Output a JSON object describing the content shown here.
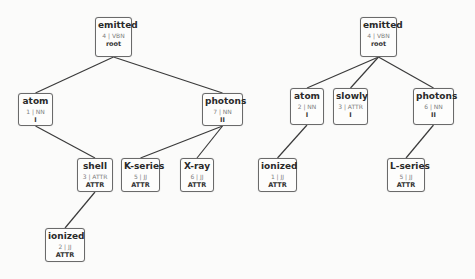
{
  "trees": [
    {
      "name": "left-tree",
      "nodes": [
        {
          "id": "L-emitted",
          "word": "emitted",
          "meta": "4 | VBN",
          "role": "root",
          "x": 95,
          "y": 17,
          "w": 37,
          "h": 40
        },
        {
          "id": "L-atom",
          "word": "atom",
          "meta": "1 | NN",
          "role": "I",
          "x": 18,
          "y": 93,
          "w": 35,
          "h": 33
        },
        {
          "id": "L-photons",
          "word": "photons",
          "meta": "7 | NN",
          "role": "II",
          "x": 202,
          "y": 93,
          "w": 41,
          "h": 33
        },
        {
          "id": "L-shell",
          "word": "shell",
          "meta": "3 | ATTR",
          "role": "ATTR",
          "x": 77,
          "y": 158,
          "w": 36,
          "h": 34
        },
        {
          "id": "L-kseries",
          "word": "K-series",
          "meta": "5 | JJ",
          "role": "ATTR",
          "x": 121,
          "y": 158,
          "w": 39,
          "h": 34
        },
        {
          "id": "L-xray",
          "word": "X-ray",
          "meta": "6 | JJ",
          "role": "ATTR",
          "x": 180,
          "y": 158,
          "w": 34,
          "h": 34
        },
        {
          "id": "L-ionized",
          "word": "ionized",
          "meta": "2 | JJ",
          "role": "ATTR",
          "x": 45,
          "y": 228,
          "w": 40,
          "h": 34
        }
      ],
      "edges": [
        [
          "L-emitted",
          "L-atom"
        ],
        [
          "L-emitted",
          "L-photons"
        ],
        [
          "L-atom",
          "L-shell"
        ],
        [
          "L-photons",
          "L-kseries"
        ],
        [
          "L-photons",
          "L-xray"
        ],
        [
          "L-shell",
          "L-ionized"
        ]
      ]
    },
    {
      "name": "right-tree",
      "nodes": [
        {
          "id": "R-emitted",
          "word": "emitted",
          "meta": "4 | VBN",
          "role": "root",
          "x": 360,
          "y": 17,
          "w": 37,
          "h": 40
        },
        {
          "id": "R-atom",
          "word": "atom",
          "meta": "2 | NN",
          "role": "I",
          "x": 290,
          "y": 88,
          "w": 34,
          "h": 37
        },
        {
          "id": "R-slowly",
          "word": "slowly",
          "meta": "3 | ATTR",
          "role": "I",
          "x": 333,
          "y": 88,
          "w": 35,
          "h": 37
        },
        {
          "id": "R-photons",
          "word": "photons",
          "meta": "6 | NN",
          "role": "II",
          "x": 413,
          "y": 88,
          "w": 41,
          "h": 37
        },
        {
          "id": "R-ionized",
          "word": "ionized",
          "meta": "1 | JJ",
          "role": "ATTR",
          "x": 258,
          "y": 158,
          "w": 39,
          "h": 34
        },
        {
          "id": "R-lseries",
          "word": "L-series",
          "meta": "5 | JJ",
          "role": "ATTR",
          "x": 387,
          "y": 158,
          "w": 38,
          "h": 34
        }
      ],
      "edges": [
        [
          "R-emitted",
          "R-atom"
        ],
        [
          "R-emitted",
          "R-slowly"
        ],
        [
          "R-emitted",
          "R-photons"
        ],
        [
          "R-atom",
          "R-ionized"
        ],
        [
          "R-photons",
          "R-lseries"
        ]
      ]
    }
  ],
  "colors": {
    "edge": "#3a3a3a",
    "border": "#6a6a6a",
    "background": "#fbfbfa"
  }
}
